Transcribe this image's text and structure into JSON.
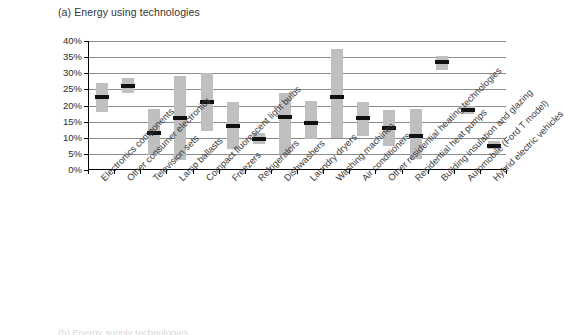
{
  "figure": {
    "panel_title": "(a) Energy using technologies",
    "bottom_caption_partial": "(b) Energy supply technologies"
  },
  "chart_data": {
    "type": "bar",
    "title": "(a) Energy using technologies",
    "xlabel": "",
    "ylabel": "",
    "ylim": [
      0,
      40
    ],
    "ytick_labels": [
      "0%",
      "5%",
      "10%",
      "15%",
      "20%",
      "25%",
      "30%",
      "35%",
      "40%"
    ],
    "ytick_values": [
      0,
      5,
      10,
      15,
      20,
      25,
      30,
      35,
      40
    ],
    "grid": true,
    "legend": "none",
    "value_unit": "percent",
    "encoding": "floating range bar (low to high) with black median marker",
    "categories": [
      "Electronics components",
      "Other consumer electronics",
      "Television sets",
      "Lamp ballasts",
      "Compact fluorescent light bulbs",
      "Freezers",
      "Refrigerators",
      "Dishwashers",
      "Laundry dryers",
      "Washing machines",
      "Air conditioners",
      "Other residential heating technologies",
      "Residential heat pumps",
      "Building insulation and glazing",
      "Automobile (Ford T model)",
      "Hybrid electric vehicles"
    ],
    "series": [
      {
        "name": "low",
        "values": [
          18.0,
          24.0,
          4.5,
          3.0,
          12.0,
          6.5,
          8.0,
          5.0,
          9.5,
          10.0,
          10.5,
          7.5,
          3.5,
          31.0,
          17.5,
          6.5
        ]
      },
      {
        "name": "median",
        "values": [
          22.5,
          26.2,
          11.5,
          16.0,
          21.0,
          13.5,
          9.5,
          16.5,
          14.5,
          22.5,
          16.0,
          13.0,
          10.5,
          33.5,
          18.5,
          7.5
        ]
      },
      {
        "name": "high",
        "values": [
          27.0,
          28.5,
          19.0,
          29.0,
          30.0,
          21.0,
          11.5,
          24.0,
          21.5,
          37.5,
          21.0,
          18.5,
          19.0,
          35.5,
          20.0,
          9.0
        ]
      }
    ]
  }
}
